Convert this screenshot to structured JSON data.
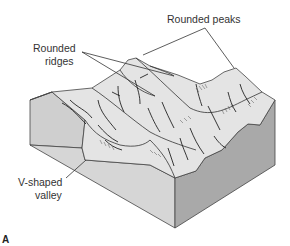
{
  "figure": {
    "panel_letter": "A",
    "labels": {
      "rounded_peaks": "Rounded peaks",
      "rounded_ridges_line1": "Rounded",
      "rounded_ridges_line2": "ridges",
      "v_valley_line1": "V-shaped",
      "v_valley_line2": "valley"
    },
    "colors": {
      "top_surface": "#e4e4e4",
      "left_face": "#cfcfcf",
      "front_face": "#d6d6d6",
      "right_face": "#a9a9a9",
      "outline": "#333333"
    }
  }
}
